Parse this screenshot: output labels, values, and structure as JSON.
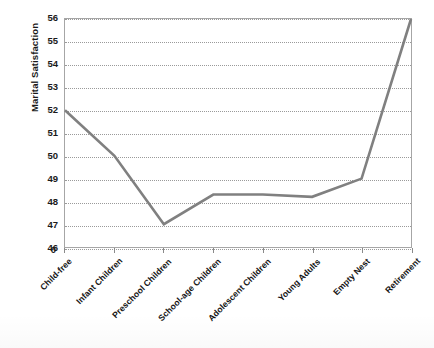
{
  "chart_data": {
    "type": "line",
    "title": "",
    "xlabel": "",
    "ylabel": "Marital Satisfaction",
    "categories": [
      "Child-free",
      "Infant Children",
      "Preschool Children",
      "School-age Children",
      "Adolescent Children",
      "Young Adults",
      "Empty Nest",
      "Retirement"
    ],
    "values": [
      52,
      50,
      47,
      48.3,
      48.3,
      48.2,
      49,
      56
    ],
    "series": [
      {
        "name": "Marital Satisfaction",
        "values": [
          52,
          50,
          47,
          48.3,
          48.3,
          48.2,
          49,
          56
        ]
      }
    ],
    "ylim": [
      46,
      56
    ],
    "yticks": [
      46,
      47,
      48,
      49,
      50,
      51,
      52,
      53,
      54,
      55,
      56
    ],
    "ytick_labels": [
      "46",
      "47",
      "48",
      "49",
      "50",
      "51",
      "52",
      "53",
      "54",
      "55",
      "56"
    ],
    "axis_break_label": "0",
    "grid": true,
    "grid_style": "dotted horizontal",
    "legend": false,
    "legend_position": "none",
    "line_color": "#808080",
    "plot_border_color": "#A6A6A6",
    "grid_color": "#9A9A9A",
    "text_color": "#1A1A1A",
    "background_color": "#FFFFFF"
  }
}
